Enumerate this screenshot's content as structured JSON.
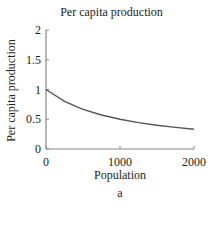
{
  "chart_data": {
    "type": "line",
    "title": "Per capita production",
    "xlabel": "Population",
    "ylabel": "Per capita production",
    "subtitle_label": "a",
    "xlim": [
      0,
      2000
    ],
    "ylim": [
      0,
      2
    ],
    "x_ticks": [
      "0",
      "1000",
      "2000"
    ],
    "y_ticks": [
      "0",
      "0.5",
      "1",
      "1.5",
      "2"
    ],
    "grid": false,
    "series": [
      {
        "name": "Per capita production",
        "color": "#555555",
        "x": [
          0,
          250,
          500,
          750,
          1000,
          1250,
          1500,
          1750,
          2000
        ],
        "y": [
          1.0,
          0.8,
          0.667,
          0.571,
          0.5,
          0.444,
          0.4,
          0.364,
          0.333
        ]
      }
    ]
  }
}
